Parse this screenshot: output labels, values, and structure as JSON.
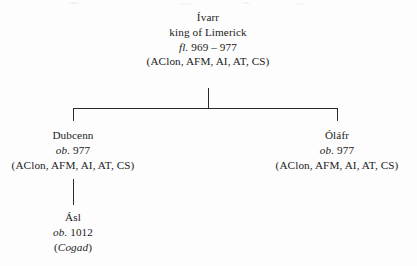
{
  "figure": {
    "type": "genealogical-family-tree",
    "generations": 3
  },
  "people": {
    "ivarr": {
      "name": "Ívarr",
      "title": "king of Limerick",
      "dates_abbr": "fl.",
      "dates_value": "969 – 977",
      "sources": "(AClon, AFM, AI, AT, CS)"
    },
    "dubcenn": {
      "name": "Dubcenn",
      "dates_abbr": "ob.",
      "dates_value": "977",
      "sources": "(AClon, AFM, AI, AT, CS)"
    },
    "olafr": {
      "name": "Óláfr",
      "dates_abbr": "ob.",
      "dates_value": "977",
      "sources": "(AClon, AFM, AI, AT, CS)"
    },
    "asl": {
      "name": "Ásl",
      "dates_abbr": "ob.",
      "dates_value": "1012",
      "sources_open": "(",
      "sources_italic": "Cogad",
      "sources_close": ")"
    }
  },
  "colors": {
    "page_background": "#fdfdfd",
    "text": "#1b1b1b",
    "rule": "#2a2a2a"
  }
}
